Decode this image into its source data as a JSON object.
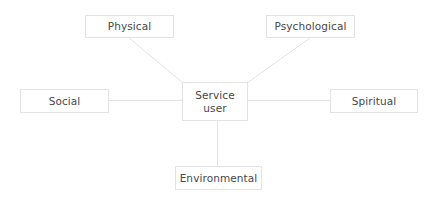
{
  "diagram": {
    "center": {
      "line1": "Service",
      "line2": "user"
    },
    "nodes": {
      "physical": "Physical",
      "psychological": "Psychological",
      "social": "Social",
      "spiritual": "Spiritual",
      "environmental": "Environmental"
    },
    "colors": {
      "line": "#e3e3e3",
      "border": "#e3e3e3",
      "text": "#474747",
      "background": "#ffffff"
    }
  }
}
